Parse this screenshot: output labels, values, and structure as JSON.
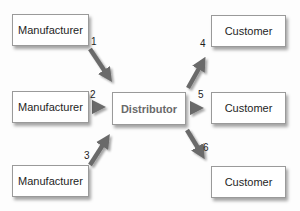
{
  "diagram": {
    "type": "flow",
    "nodes": {
      "manufacturers": [
        {
          "id": "m1",
          "label": "Manufacturer"
        },
        {
          "id": "m2",
          "label": "Manufacturer"
        },
        {
          "id": "m3",
          "label": "Manufacturer"
        }
      ],
      "distributor": {
        "id": "d",
        "label": "Distributor"
      },
      "customers": [
        {
          "id": "c1",
          "label": "Customer"
        },
        {
          "id": "c2",
          "label": "Customer"
        },
        {
          "id": "c3",
          "label": "Customer"
        }
      ]
    },
    "edges": [
      {
        "from": "m1",
        "to": "d",
        "label": "1"
      },
      {
        "from": "m2",
        "to": "d",
        "label": "2"
      },
      {
        "from": "m3",
        "to": "d",
        "label": "3"
      },
      {
        "from": "d",
        "to": "c1",
        "label": "4"
      },
      {
        "from": "d",
        "to": "c2",
        "label": "5"
      },
      {
        "from": "d",
        "to": "c3",
        "label": "6"
      }
    ],
    "colors": {
      "arrow": "#6b6b6b",
      "border": "#9a9a9a",
      "text": "#1e1e1e",
      "distributor_text": "#6a6a6a"
    }
  }
}
